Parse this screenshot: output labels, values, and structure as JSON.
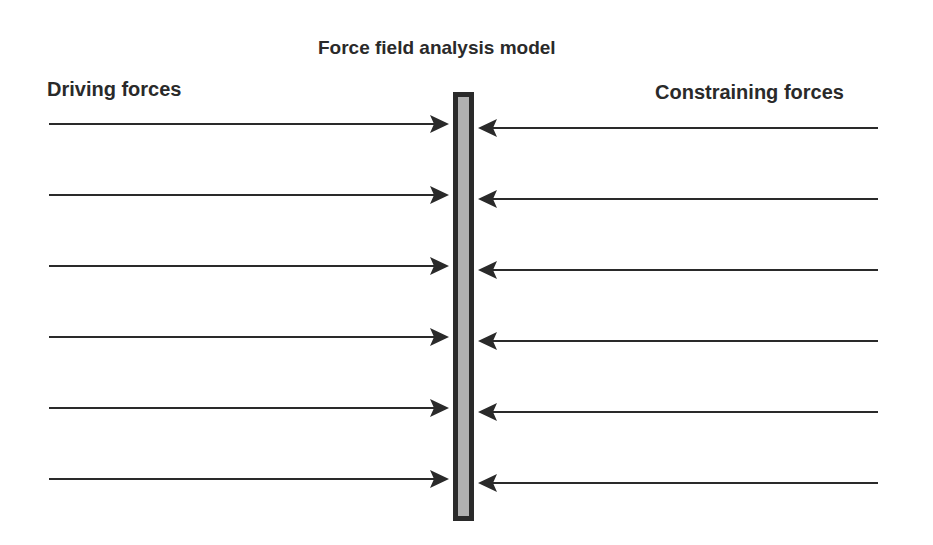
{
  "title": "Force field analysis model",
  "left_label": "Driving forces",
  "right_label": "Constraining forces",
  "colors": {
    "text": "#2a2a2a",
    "arrow": "#2a2a2a",
    "bar_border": "#2a2a2a",
    "bar_fill": "#b0b0b0",
    "background": "#ffffff"
  },
  "bar": {
    "x": 453,
    "y": 92,
    "width": 21,
    "height": 429,
    "border": 5
  },
  "driving_arrows": [
    {
      "x1": 49,
      "x2": 449,
      "y": 124
    },
    {
      "x1": 49,
      "x2": 449,
      "y": 195
    },
    {
      "x1": 49,
      "x2": 449,
      "y": 266
    },
    {
      "x1": 49,
      "x2": 449,
      "y": 337
    },
    {
      "x1": 49,
      "x2": 449,
      "y": 408
    },
    {
      "x1": 49,
      "x2": 449,
      "y": 479
    }
  ],
  "constraining_arrows": [
    {
      "x1": 878,
      "x2": 478,
      "y": 128
    },
    {
      "x1": 878,
      "x2": 478,
      "y": 199
    },
    {
      "x1": 878,
      "x2": 478,
      "y": 270
    },
    {
      "x1": 878,
      "x2": 478,
      "y": 341
    },
    {
      "x1": 878,
      "x2": 478,
      "y": 412
    },
    {
      "x1": 878,
      "x2": 478,
      "y": 483
    }
  ]
}
